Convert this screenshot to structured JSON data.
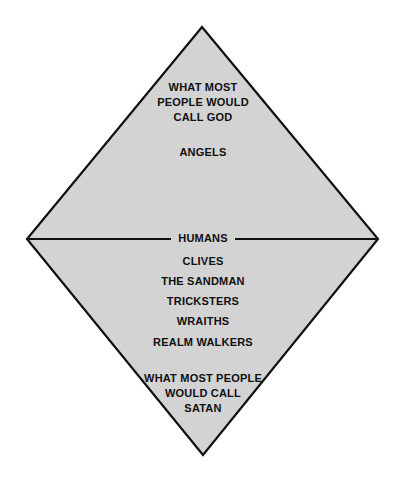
{
  "diagram": {
    "type": "diamond-hierarchy",
    "shape_name": "rhombus",
    "colors": {
      "fill": "#d3d3d3",
      "stroke": "#101010",
      "text": "#101010",
      "background": "#ffffff"
    },
    "geometry": {
      "top_vertex": "202,27",
      "right_vertex": "378,239",
      "bottom_vertex": "203,455",
      "left_vertex": "27,239",
      "divider_y": 239
    },
    "upper_section": {
      "primary_block": {
        "lines": [
          "WHAT MOST",
          "PEOPLE WOULD",
          "CALL GOD"
        ]
      },
      "secondary_label": "ANGELS"
    },
    "divider": {
      "label": "HUMANS"
    },
    "lower_section": {
      "list": [
        "CLIVES",
        "THE SANDMAN",
        "TRICKSTERS",
        "WRAITHS",
        "REALM WALKERS"
      ],
      "bottom_block": {
        "lines": [
          "WHAT MOST PEOPLE",
          "WOULD CALL",
          "SATAN"
        ]
      }
    }
  }
}
